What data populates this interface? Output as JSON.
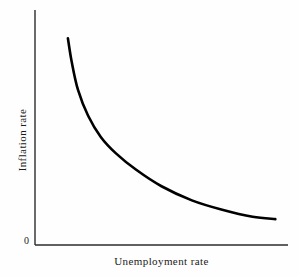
{
  "figure": {
    "type": "line-chart",
    "background_color": "#fefefe",
    "axis_color": "#2b2b2b",
    "curve_color": "#000000"
  },
  "axes": {
    "origin_label": "0",
    "x_axis_label": "Unemployment rate",
    "y_axis_label": "Inflation rate"
  },
  "chart_data": {
    "type": "line",
    "title": "",
    "subtitle": "",
    "xlabel": "Unemployment rate",
    "ylabel": "Inflation rate",
    "xlim": [
      0,
      10
    ],
    "ylim": [
      0,
      10
    ],
    "grid": false,
    "legend": null,
    "axis_tick_labels": {
      "x": [],
      "y": [
        "0"
      ]
    },
    "annotations": [],
    "series": [
      {
        "name": "Phillips curve",
        "color": "#000000",
        "line_width": 2.6,
        "x": [
          1.3,
          1.45,
          1.7,
          2.1,
          2.6,
          3.2,
          4.0,
          5.0,
          6.2,
          7.4,
          8.6,
          9.5
        ],
        "y": [
          8.8,
          7.8,
          6.6,
          5.5,
          4.6,
          3.9,
          3.2,
          2.5,
          1.9,
          1.5,
          1.2,
          1.1
        ]
      }
    ]
  }
}
